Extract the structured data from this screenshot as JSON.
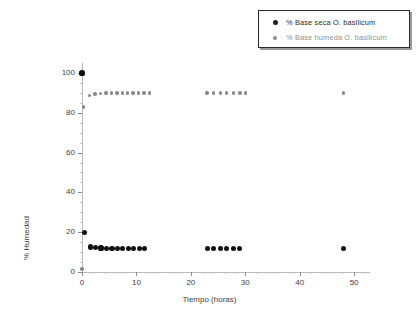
{
  "chart_data": {
    "type": "scatter",
    "title": "",
    "xlabel": "Tiempo (horas)",
    "ylabel": "% Humedad",
    "xlim": [
      0,
      52
    ],
    "ylim": [
      0,
      104
    ],
    "xticks": [
      0,
      10,
      20,
      30,
      40,
      50
    ],
    "yticks": [
      0,
      20,
      40,
      60,
      80,
      100
    ],
    "xtick_labels": [
      "0",
      "10",
      "20",
      "30",
      "40",
      "50"
    ],
    "ytick_labels": [
      "0",
      "20",
      "40",
      "60",
      "80",
      "100"
    ],
    "grid": false,
    "legend_position": "top-right",
    "series": [
      {
        "name": "% Base seca O. basilicum",
        "marker": "circle",
        "color": "#111111",
        "points": [
          {
            "x": 0.0,
            "y": 100.0
          },
          {
            "x": 0.5,
            "y": 20.0
          },
          {
            "x": 1.5,
            "y": 12.6
          },
          {
            "x": 2.5,
            "y": 12.3
          },
          {
            "x": 3.5,
            "y": 12.1
          },
          {
            "x": 4.5,
            "y": 12.0
          },
          {
            "x": 5.5,
            "y": 12.0
          },
          {
            "x": 6.5,
            "y": 12.0
          },
          {
            "x": 7.5,
            "y": 12.0
          },
          {
            "x": 8.5,
            "y": 12.0
          },
          {
            "x": 9.5,
            "y": 12.0
          },
          {
            "x": 10.5,
            "y": 12.0
          },
          {
            "x": 11.5,
            "y": 12.0
          },
          {
            "x": 23.0,
            "y": 12.0
          },
          {
            "x": 24.2,
            "y": 12.0
          },
          {
            "x": 25.4,
            "y": 12.0
          },
          {
            "x": 26.6,
            "y": 12.0
          },
          {
            "x": 27.8,
            "y": 12.0
          },
          {
            "x": 29.0,
            "y": 12.0
          },
          {
            "x": 48.0,
            "y": 12.0
          }
        ]
      },
      {
        "name": "% Base humeda O. basilicum",
        "marker": "circle",
        "color": "#8a8a8a",
        "points": [
          {
            "x": 0.0,
            "y": 1.5
          },
          {
            "x": 0.3,
            "y": 83.0
          },
          {
            "x": 1.4,
            "y": 88.6
          },
          {
            "x": 2.4,
            "y": 89.4
          },
          {
            "x": 3.4,
            "y": 89.7
          },
          {
            "x": 4.4,
            "y": 89.9
          },
          {
            "x": 5.4,
            "y": 90.0
          },
          {
            "x": 6.4,
            "y": 90.0
          },
          {
            "x": 7.4,
            "y": 90.0
          },
          {
            "x": 8.4,
            "y": 90.0
          },
          {
            "x": 9.4,
            "y": 90.0
          },
          {
            "x": 10.4,
            "y": 90.0
          },
          {
            "x": 11.4,
            "y": 90.0
          },
          {
            "x": 12.4,
            "y": 90.0
          },
          {
            "x": 23.0,
            "y": 90.0
          },
          {
            "x": 24.2,
            "y": 90.0
          },
          {
            "x": 25.4,
            "y": 90.0
          },
          {
            "x": 26.6,
            "y": 90.0
          },
          {
            "x": 27.8,
            "y": 90.0
          },
          {
            "x": 29.0,
            "y": 90.0
          },
          {
            "x": 30.0,
            "y": 90.0
          },
          {
            "x": 48.0,
            "y": 90.0
          }
        ]
      }
    ]
  },
  "legend": {
    "entries": [
      {
        "label": "% Base seca O. basilicum"
      },
      {
        "label": "% Base humeda O. basilicum"
      }
    ]
  }
}
